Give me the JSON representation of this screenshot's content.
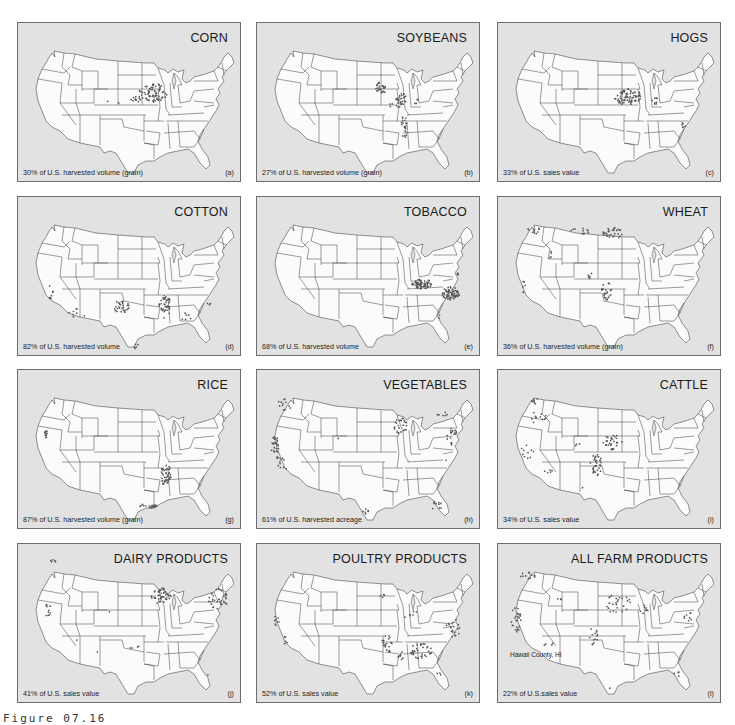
{
  "figure": {
    "caption": "Figure 07.16"
  },
  "colors": {
    "panel_background": "#e2e2e2",
    "land": "#fbfbfb",
    "borders": "#3a3a3a",
    "dots": "#555555"
  },
  "panels": [
    {
      "id": "a",
      "title": "CORN",
      "caption": "30% of U.S. harvested volume (grain)",
      "letter": "(a)",
      "clusters": [
        {
          "cx": 135,
          "cy": 70,
          "rx": 14,
          "ry": 10,
          "n": 70
        },
        {
          "cx": 118,
          "cy": 76,
          "rx": 5,
          "ry": 3,
          "n": 12
        },
        {
          "cx": 89,
          "cy": 78,
          "rx": 1,
          "ry": 1,
          "n": 1
        },
        {
          "cx": 101,
          "cy": 80,
          "rx": 1,
          "ry": 1,
          "n": 1
        }
      ]
    },
    {
      "id": "b",
      "title": "SOYBEANS",
      "caption": "27% of U.S. harvested volume (grain)",
      "letter": "(b)",
      "clusters": [
        {
          "cx": 124,
          "cy": 64,
          "rx": 6,
          "ry": 7,
          "n": 28
        },
        {
          "cx": 144,
          "cy": 78,
          "rx": 6,
          "ry": 9,
          "n": 30
        },
        {
          "cx": 147,
          "cy": 104,
          "rx": 3,
          "ry": 12,
          "n": 22
        },
        {
          "cx": 134,
          "cy": 82,
          "rx": 2,
          "ry": 2,
          "n": 3
        },
        {
          "cx": 158,
          "cy": 78,
          "rx": 3,
          "ry": 3,
          "n": 4
        }
      ]
    },
    {
      "id": "c",
      "title": "HOGS",
      "caption": "33% of U.S. sales value",
      "letter": "(c)",
      "clusters": [
        {
          "cx": 130,
          "cy": 74,
          "rx": 14,
          "ry": 8,
          "n": 75
        },
        {
          "cx": 157,
          "cy": 78,
          "rx": 3,
          "ry": 4,
          "n": 8
        },
        {
          "cx": 186,
          "cy": 102,
          "rx": 3,
          "ry": 3,
          "n": 6
        }
      ]
    },
    {
      "id": "d",
      "title": "COTTON",
      "caption": "82% of U.S. harvested volume",
      "letter": "(d)",
      "clusters": [
        {
          "cx": 103,
          "cy": 110,
          "rx": 8,
          "ry": 7,
          "n": 30
        },
        {
          "cx": 147,
          "cy": 110,
          "rx": 6,
          "ry": 12,
          "n": 40
        },
        {
          "cx": 33,
          "cy": 95,
          "rx": 3,
          "ry": 7,
          "n": 8
        },
        {
          "cx": 60,
          "cy": 116,
          "rx": 9,
          "ry": 5,
          "n": 8
        },
        {
          "cx": 168,
          "cy": 120,
          "rx": 6,
          "ry": 4,
          "n": 6
        },
        {
          "cx": 118,
          "cy": 150,
          "rx": 3,
          "ry": 3,
          "n": 5
        },
        {
          "cx": 190,
          "cy": 108,
          "rx": 3,
          "ry": 3,
          "n": 3
        }
      ]
    },
    {
      "id": "e",
      "title": "TOBACCO",
      "caption": "68% of U.S. harvested volume",
      "letter": "(e)",
      "clusters": [
        {
          "cx": 165,
          "cy": 87,
          "rx": 10,
          "ry": 5,
          "n": 70
        },
        {
          "cx": 194,
          "cy": 96,
          "rx": 9,
          "ry": 7,
          "n": 70
        },
        {
          "cx": 201,
          "cy": 78,
          "rx": 2,
          "ry": 2,
          "n": 4
        },
        {
          "cx": 182,
          "cy": 119,
          "rx": 2,
          "ry": 2,
          "n": 2
        }
      ]
    },
    {
      "id": "f",
      "title": "WHEAT",
      "caption": "36% of U.S. harvested volume (grain)",
      "letter": "(f)",
      "clusters": [
        {
          "cx": 115,
          "cy": 36,
          "rx": 10,
          "ry": 6,
          "n": 30
        },
        {
          "cx": 82,
          "cy": 34,
          "rx": 10,
          "ry": 3,
          "n": 12
        },
        {
          "cx": 36,
          "cy": 34,
          "rx": 7,
          "ry": 4,
          "n": 10
        },
        {
          "cx": 108,
          "cy": 94,
          "rx": 6,
          "ry": 9,
          "n": 25
        },
        {
          "cx": 92,
          "cy": 79,
          "rx": 4,
          "ry": 3,
          "n": 6
        },
        {
          "cx": 26,
          "cy": 90,
          "rx": 2,
          "ry": 6,
          "n": 6
        },
        {
          "cx": 52,
          "cy": 58,
          "rx": 3,
          "ry": 4,
          "n": 4
        }
      ]
    },
    {
      "id": "g",
      "title": "RICE",
      "caption": "87% of U.S. harvested volume (grain)",
      "letter": "(g)",
      "clusters": [
        {
          "cx": 28,
          "cy": 64,
          "rx": 2,
          "ry": 4,
          "n": 12
        },
        {
          "cx": 148,
          "cy": 104,
          "rx": 5,
          "ry": 12,
          "n": 45
        },
        {
          "cx": 130,
          "cy": 136,
          "rx": 9,
          "ry": 2,
          "n": 20
        }
      ]
    },
    {
      "id": "h",
      "title": "VEGETABLES",
      "caption": "61% of U.S. harvested acreage",
      "letter": "(h)",
      "clusters": [
        {
          "cx": 18,
          "cy": 76,
          "rx": 4,
          "ry": 10,
          "n": 25
        },
        {
          "cx": 25,
          "cy": 92,
          "rx": 8,
          "ry": 8,
          "n": 12
        },
        {
          "cx": 28,
          "cy": 34,
          "rx": 8,
          "ry": 6,
          "n": 12
        },
        {
          "cx": 144,
          "cy": 56,
          "rx": 7,
          "ry": 8,
          "n": 25
        },
        {
          "cx": 194,
          "cy": 66,
          "rx": 6,
          "ry": 10,
          "n": 18
        },
        {
          "cx": 185,
          "cy": 44,
          "rx": 6,
          "ry": 2,
          "n": 6
        },
        {
          "cx": 180,
          "cy": 136,
          "rx": 5,
          "ry": 5,
          "n": 10
        },
        {
          "cx": 110,
          "cy": 141,
          "rx": 6,
          "ry": 3,
          "n": 6
        },
        {
          "cx": 82,
          "cy": 68,
          "rx": 1,
          "ry": 1,
          "n": 1
        },
        {
          "cx": 189,
          "cy": 90,
          "rx": 1,
          "ry": 1,
          "n": 1
        }
      ]
    },
    {
      "id": "i",
      "title": "CATTLE",
      "caption": "34% of U.S. sales value",
      "letter": "(i)",
      "clusters": [
        {
          "cx": 98,
          "cy": 94,
          "rx": 6,
          "ry": 12,
          "n": 35
        },
        {
          "cx": 115,
          "cy": 72,
          "rx": 10,
          "ry": 8,
          "n": 30
        },
        {
          "cx": 30,
          "cy": 82,
          "rx": 7,
          "ry": 10,
          "n": 10
        },
        {
          "cx": 40,
          "cy": 48,
          "rx": 12,
          "ry": 6,
          "n": 12
        },
        {
          "cx": 36,
          "cy": 30,
          "rx": 5,
          "ry": 4,
          "n": 6
        },
        {
          "cx": 50,
          "cy": 102,
          "rx": 6,
          "ry": 3,
          "n": 5
        },
        {
          "cx": 80,
          "cy": 75,
          "rx": 3,
          "ry": 2,
          "n": 3
        },
        {
          "cx": 85,
          "cy": 118,
          "rx": 1,
          "ry": 1,
          "n": 1
        }
      ]
    },
    {
      "id": "j",
      "title": "DAIRY PRODUCTS",
      "caption": "41% of U.S. sales value",
      "letter": "(j)",
      "clusters": [
        {
          "cx": 143,
          "cy": 52,
          "rx": 10,
          "ry": 8,
          "n": 45
        },
        {
          "cx": 200,
          "cy": 55,
          "rx": 10,
          "ry": 10,
          "n": 35
        },
        {
          "cx": 30,
          "cy": 66,
          "rx": 3,
          "ry": 7,
          "n": 10
        },
        {
          "cx": 35,
          "cy": 18,
          "rx": 3,
          "ry": 3,
          "n": 5
        },
        {
          "cx": 113,
          "cy": 105,
          "rx": 14,
          "ry": 4,
          "n": 4
        },
        {
          "cx": 92,
          "cy": 68,
          "rx": 1,
          "ry": 1,
          "n": 1
        },
        {
          "cx": 58,
          "cy": 96,
          "rx": 1,
          "ry": 1,
          "n": 1
        },
        {
          "cx": 80,
          "cy": 108,
          "rx": 1,
          "ry": 1,
          "n": 1
        },
        {
          "cx": 190,
          "cy": 130,
          "rx": 1,
          "ry": 1,
          "n": 1
        }
      ]
    },
    {
      "id": "k",
      "title": "POULTRY PRODUCTS",
      "caption": "52% of U.S. sales value",
      "letter": "(k)",
      "clusters": [
        {
          "cx": 165,
          "cy": 107,
          "rx": 12,
          "ry": 8,
          "n": 35
        },
        {
          "cx": 130,
          "cy": 100,
          "rx": 5,
          "ry": 9,
          "n": 20
        },
        {
          "cx": 196,
          "cy": 84,
          "rx": 8,
          "ry": 9,
          "n": 20
        },
        {
          "cx": 145,
          "cy": 112,
          "rx": 4,
          "ry": 5,
          "n": 8
        },
        {
          "cx": 20,
          "cy": 76,
          "rx": 3,
          "ry": 6,
          "n": 8
        },
        {
          "cx": 28,
          "cy": 96,
          "rx": 3,
          "ry": 4,
          "n": 5
        },
        {
          "cx": 155,
          "cy": 72,
          "rx": 8,
          "ry": 6,
          "n": 6
        },
        {
          "cx": 125,
          "cy": 50,
          "rx": 6,
          "ry": 5,
          "n": 4
        },
        {
          "cx": 182,
          "cy": 130,
          "rx": 2,
          "ry": 2,
          "n": 3
        }
      ]
    },
    {
      "id": "l",
      "title": "ALL FARM PRODUCTS",
      "caption": "22% of U.S.sales value",
      "letter": "(l)",
      "annotation": "Hawaii County, HI",
      "clusters": [
        {
          "cx": 18,
          "cy": 76,
          "rx": 5,
          "ry": 14,
          "n": 25
        },
        {
          "cx": 30,
          "cy": 32,
          "rx": 8,
          "ry": 4,
          "n": 10
        },
        {
          "cx": 120,
          "cy": 60,
          "rx": 14,
          "ry": 10,
          "n": 25
        },
        {
          "cx": 95,
          "cy": 92,
          "rx": 5,
          "ry": 9,
          "n": 14
        },
        {
          "cx": 148,
          "cy": 66,
          "rx": 6,
          "ry": 5,
          "n": 8
        },
        {
          "cx": 190,
          "cy": 72,
          "rx": 5,
          "ry": 6,
          "n": 8
        },
        {
          "cx": 50,
          "cy": 100,
          "rx": 5,
          "ry": 3,
          "n": 4
        },
        {
          "cx": 60,
          "cy": 55,
          "rx": 4,
          "ry": 3,
          "n": 3
        },
        {
          "cx": 180,
          "cy": 130,
          "rx": 4,
          "ry": 4,
          "n": 4
        },
        {
          "cx": 112,
          "cy": 144,
          "rx": 1,
          "ry": 1,
          "n": 1
        }
      ]
    }
  ]
}
